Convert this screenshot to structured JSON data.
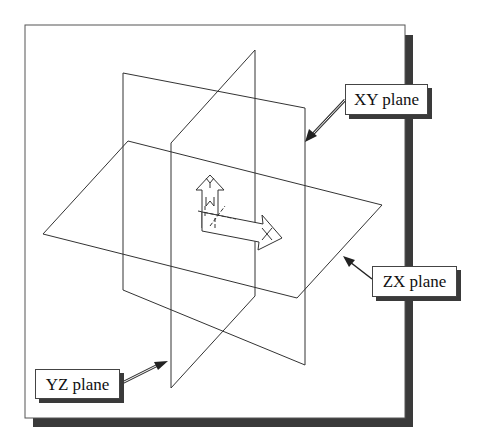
{
  "figure": {
    "planes": [
      {
        "id": "xy",
        "label": "XY plane"
      },
      {
        "id": "zx",
        "label": "ZX plane"
      },
      {
        "id": "yz",
        "label": "YZ plane"
      }
    ],
    "axes": {
      "x_label": "X",
      "y_label": "Y",
      "z_label": "Z"
    },
    "colors": {
      "line": "#333333",
      "shadow": "#3a3a3a",
      "background": "#ffffff"
    }
  }
}
